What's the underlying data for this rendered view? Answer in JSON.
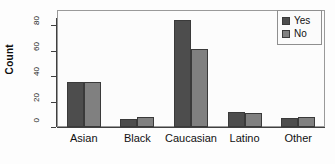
{
  "chart_data": {
    "type": "bar",
    "title": "",
    "xlabel": "",
    "ylabel": "Count",
    "categories": [
      "Asian",
      "Black",
      "Caucasian",
      "Latino",
      "Other"
    ],
    "series": [
      {
        "name": "Yes",
        "color": "#4d4d4d",
        "values": [
          35,
          6,
          84,
          12,
          7
        ]
      },
      {
        "name": "No",
        "color": "#808080",
        "values": [
          35,
          8,
          61,
          11,
          8
        ]
      }
    ],
    "ylim": [
      0,
      88
    ],
    "yticks": [
      0,
      20,
      40,
      60,
      80
    ],
    "ytick_labels": [
      "0",
      "20",
      "40",
      "60",
      "80"
    ],
    "grid": false,
    "legend_position": "top-right",
    "legend_entries": [
      "Yes",
      "No"
    ]
  }
}
